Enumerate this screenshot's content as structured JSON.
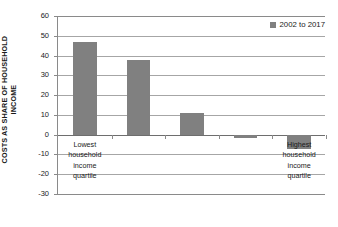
{
  "chart_data": {
    "type": "bar",
    "title": "",
    "xlabel": "",
    "ylabel": "COSTS AS SHARE OF HOUSEHOLD INCOME",
    "ylabel_line1": "COSTS AS SHARE OF HOUSEHOLD",
    "ylabel_line2": "INCOME",
    "ylim": [
      -30,
      60
    ],
    "ytick_step": 10,
    "yticks": [
      60,
      50,
      40,
      30,
      20,
      10,
      0,
      -10,
      -20,
      -30
    ],
    "ytick_labels": [
      "60",
      "50",
      "40",
      "30",
      "20",
      "10",
      "0",
      "-10",
      "-20",
      "-30"
    ],
    "grid": true,
    "grid_axis": "y",
    "legend_position": "top-right",
    "categories": [
      "Lowest household income quartile",
      "",
      "",
      "",
      "Highest household income quartile"
    ],
    "category_labels_visible": [
      {
        "index": 0,
        "lines": [
          "Lowest",
          "household",
          "income",
          "quartile"
        ]
      },
      {
        "index": 4,
        "lines": [
          "Highest",
          "household",
          "income",
          "quartile"
        ]
      }
    ],
    "series": [
      {
        "name": "2002 to 2017",
        "color": "#808080",
        "values": [
          47.0,
          37.7,
          10.8,
          -1.5,
          -7.5
        ]
      }
    ]
  },
  "legend": {
    "entries": [
      {
        "label": "2002 to 2017",
        "color": "#808080",
        "marker": "square-swatch"
      }
    ]
  },
  "colors": {
    "bar": "#808080",
    "gridline": "#a6a6a6",
    "axis": "#8a8a8a",
    "text": "#1a1a1a",
    "background": "#ffffff"
  }
}
